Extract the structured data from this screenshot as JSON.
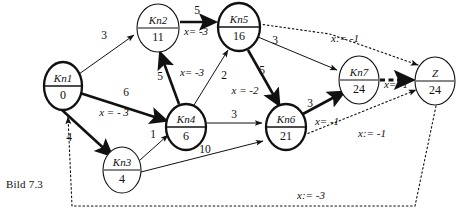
{
  "figure": {
    "caption": "Bild 7.3",
    "title": "Bild 7.3"
  },
  "nodes": [
    {
      "id": "Kn1",
      "label": "Kn1",
      "value": "0",
      "cx": 63,
      "cy": 86,
      "rx": 19,
      "ry": 24,
      "emphasis": "bold"
    },
    {
      "id": "Kn2",
      "label": "Kn2",
      "value": "11",
      "cx": 158,
      "cy": 28,
      "rx": 21,
      "ry": 24,
      "emphasis": "thin"
    },
    {
      "id": "Kn3",
      "label": "Kn3",
      "value": "4",
      "cx": 122,
      "cy": 170,
      "rx": 19,
      "ry": 23,
      "emphasis": "thin"
    },
    {
      "id": "Kn4",
      "label": "Kn4",
      "value": "6",
      "cx": 186,
      "cy": 127,
      "rx": 20,
      "ry": 23,
      "emphasis": "bold"
    },
    {
      "id": "Kn5",
      "label": "Kn5",
      "value": "16",
      "cx": 239,
      "cy": 27,
      "rx": 21,
      "ry": 24,
      "emphasis": "bold"
    },
    {
      "id": "Kn6",
      "label": "Kn6",
      "value": "21",
      "cx": 286,
      "cy": 127,
      "rx": 20,
      "ry": 23,
      "emphasis": "bold"
    },
    {
      "id": "Kn7",
      "label": "Kn7",
      "value": "24",
      "cx": 359,
      "cy": 80,
      "rx": 20,
      "ry": 24,
      "emphasis": "thin"
    },
    {
      "id": "Z",
      "label": "Z",
      "value": "24",
      "cx": 435,
      "cy": 81,
      "rx": 20,
      "ry": 24,
      "emphasis": "thin"
    }
  ],
  "edges": [
    {
      "id": "kn1-kn2",
      "from": "Kn1",
      "to": "Kn2",
      "weight": "3",
      "assign": "",
      "style": "thin"
    },
    {
      "id": "kn1-kn4",
      "from": "Kn1",
      "to": "Kn4",
      "weight": "6",
      "assign": "x = - 3",
      "style": "bold"
    },
    {
      "id": "kn1-kn3",
      "from": "Kn1",
      "to": "Kn3",
      "weight": "4",
      "assign": "",
      "style": "bold"
    },
    {
      "id": "kn4-kn2",
      "from": "Kn4",
      "to": "Kn2",
      "weight": "5",
      "assign": "x= -3",
      "style": "bold"
    },
    {
      "id": "kn4-kn5",
      "from": "Kn4",
      "to": "Kn5",
      "weight": "2",
      "assign": "",
      "style": "thin"
    },
    {
      "id": "kn2-kn5",
      "from": "Kn2",
      "to": "Kn5",
      "weight": "5",
      "assign": "x= -3",
      "style": "bold"
    },
    {
      "id": "kn3-kn4",
      "from": "Kn3",
      "to": "Kn4",
      "weight": "1",
      "assign": "",
      "style": "thin"
    },
    {
      "id": "kn4-kn6",
      "from": "Kn4",
      "to": "Kn6",
      "weight": "3",
      "assign": "",
      "style": "thin"
    },
    {
      "id": "kn3-kn6",
      "from": "Kn3",
      "to": "Kn6",
      "weight": "10",
      "assign": "",
      "style": "thin"
    },
    {
      "id": "kn5-kn6",
      "from": "Kn5",
      "to": "Kn6",
      "weight": "5",
      "assign": "x = -2",
      "style": "bold"
    },
    {
      "id": "kn5-kn7",
      "from": "Kn5",
      "to": "Kn7",
      "weight": "3",
      "assign": "",
      "style": "thin"
    },
    {
      "id": "kn6-kn7",
      "from": "Kn6",
      "to": "Kn7",
      "weight": "3",
      "assign": "x= -1",
      "style": "bold"
    },
    {
      "id": "kn7-z",
      "from": "Kn7",
      "to": "Z",
      "weight": "",
      "assign": "x= -1",
      "style": "dash-bold"
    },
    {
      "id": "kn5-z",
      "from": "Kn5",
      "to": "Z",
      "weight": "",
      "assign": "x:= -1",
      "style": "dotted"
    },
    {
      "id": "kn6-z",
      "from": "Kn6",
      "to": "Z",
      "weight": "",
      "assign": "x:= -1",
      "style": "dotted"
    },
    {
      "id": "z-kn1",
      "from": "Z",
      "to": "Kn1",
      "weight": "",
      "assign": "x:=  -3",
      "style": "dotted"
    }
  ],
  "labels": {
    "kn1_kn2_weight": "3",
    "kn1_kn4_weight": "6",
    "kn1_kn4_assign": "x = - 3",
    "kn1_kn3_weight": "4",
    "kn4_kn2_weight": "5",
    "kn4_kn2_assign": "x= -3",
    "kn4_kn5_weight": "2",
    "kn2_kn5_weight": "5",
    "kn2_kn5_assign": "x= -3",
    "kn3_kn4_weight": "1",
    "kn4_kn6_weight": "3",
    "kn3_kn6_weight": "10",
    "kn5_kn6_weight": "5",
    "kn5_kn6_assign": "x = -2",
    "kn5_kn7_weight": "3",
    "kn6_kn7_weight": "3",
    "kn6_kn7_assign": "x= -1",
    "kn7_z_assign": "x= -1",
    "kn5_z_assign": "x:= -1",
    "kn6_z_assign": "x:= -1",
    "z_kn1_assign": "x:=  -3"
  }
}
